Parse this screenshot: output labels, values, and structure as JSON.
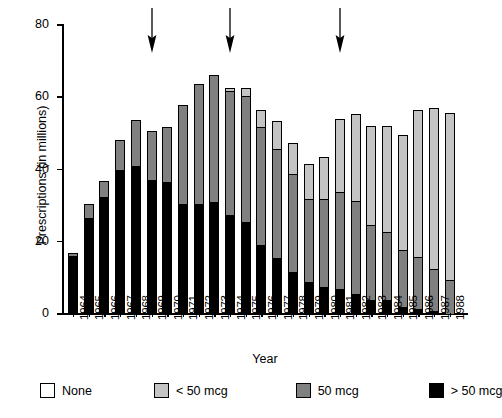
{
  "chart_data": {
    "type": "bar",
    "stacked": true,
    "title": "",
    "xlabel": "Year",
    "ylabel": "Prescriptions (in millions)",
    "ylim": [
      0,
      80
    ],
    "yticks": [
      0,
      20,
      40,
      60,
      80
    ],
    "grid": false,
    "legend_position": "bottom",
    "categories": [
      "1964",
      "1965",
      "1966",
      "1967",
      "1968",
      "1969",
      "1970",
      "1971",
      "1972",
      "1973",
      "1974",
      "1975",
      "1976",
      "1977",
      "1978",
      "1979",
      "1980",
      "1981",
      "1982",
      "1983",
      "1984",
      "1985",
      "1986",
      "1987",
      "1988"
    ],
    "series": [
      {
        "name": "> 50 mcg",
        "color": "#000000",
        "values": [
          16.0,
          26.5,
          32.5,
          40.0,
          41.0,
          37.0,
          36.5,
          30.5,
          30.5,
          31.0,
          27.5,
          25.5,
          19.0,
          15.5,
          11.5,
          9.0,
          7.5,
          7.0,
          5.5,
          4.0,
          4.0,
          2.0,
          1.5,
          0.8,
          0.0
        ]
      },
      {
        "name": "50 mcg",
        "color": "#808080",
        "values": [
          1.2,
          4.3,
          4.5,
          8.5,
          13.0,
          14.0,
          15.5,
          27.5,
          33.5,
          35.5,
          34.5,
          35.0,
          33.0,
          30.5,
          27.5,
          23.0,
          24.5,
          27.0,
          26.0,
          21.0,
          19.0,
          16.0,
          14.5,
          12.0,
          9.5
        ]
      },
      {
        "name": "< 50 mcg",
        "color": "#c4c4c4",
        "values": [
          0.0,
          0.0,
          0.0,
          0.0,
          0.0,
          0.0,
          0.0,
          0.0,
          0.0,
          0.0,
          1.0,
          2.5,
          5.0,
          8.0,
          9.0,
          10.0,
          12.0,
          20.5,
          24.5,
          27.5,
          29.5,
          32.0,
          41.0,
          44.7,
          46.5
        ]
      },
      {
        "name": "None",
        "color": "#ffffff",
        "values": [
          0,
          0,
          0,
          0,
          0,
          0,
          0,
          0,
          0,
          0,
          0,
          0,
          0,
          0,
          0,
          0,
          0,
          0,
          0,
          0,
          0,
          0,
          0,
          0,
          0
        ]
      }
    ],
    "totals": [
      17.2,
      30.8,
      37.0,
      48.5,
      54.0,
      51.0,
      52.0,
      58.0,
      64.0,
      66.5,
      63.0,
      63.0,
      57.0,
      54.0,
      48.0,
      42.0,
      44.0,
      54.5,
      56.0,
      52.5,
      52.5,
      50.0,
      57.0,
      57.5,
      56.0
    ],
    "annotations": [
      {
        "type": "arrow",
        "direction": "down",
        "at_category": "1969"
      },
      {
        "type": "arrow",
        "direction": "down",
        "at_category": "1974"
      },
      {
        "type": "arrow",
        "direction": "down",
        "at_category": "1981"
      }
    ]
  },
  "legend": {
    "items": [
      {
        "label": "None",
        "swatch": "none"
      },
      {
        "label": "< 50 mcg",
        "swatch": "lt50"
      },
      {
        "label": "50 mcg",
        "swatch": "eq50"
      },
      {
        "label": "> 50 mcg",
        "swatch": "gt50"
      }
    ]
  },
  "colors": {
    "none": "#ffffff",
    "lt50": "#c4c4c4",
    "eq50": "#808080",
    "gt50": "#000000",
    "axis": "#000000",
    "background": "#ffffff"
  }
}
